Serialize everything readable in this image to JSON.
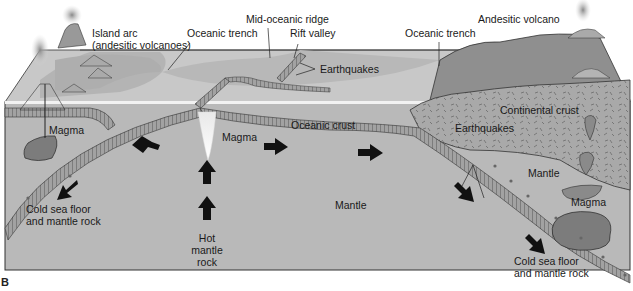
{
  "figure": {
    "panel_letter": "B",
    "type": "cross-section diagram"
  },
  "colors": {
    "mantle": "#b9b9b9",
    "ocean_surface": "#c9c9c9",
    "sea_floor": "#b0b0b0",
    "oceanic_crust": "#9a9a9a",
    "continental_crust": "#a8a8a8",
    "continent_land": "#8f8f8f",
    "magma": "#7c7c7c",
    "arrow": "#111111",
    "outline": "#333333"
  },
  "labels": {
    "island_arc_line1": "Island arc",
    "island_arc_line2": "(andesitic volcanoes)",
    "oceanic_trench_left": "Oceanic trench",
    "mid_oceanic_ridge": "Mid-oceanic ridge",
    "rift_valley": "Rift valley",
    "oceanic_trench_right": "Oceanic trench",
    "andesitic_volcano": "Andesitic volcano",
    "earthquakes_top": "Earthquakes",
    "continental_crust": "Continental crust",
    "earthquakes_mid": "Earthquakes",
    "magma_left": "Magma",
    "magma_center": "Magma",
    "oceanic_crust": "Oceanic crust",
    "mantle_right": "Mantle",
    "magma_right": "Magma",
    "mantle_center": "Mantle",
    "cold_left_line1": "Cold sea floor",
    "cold_left_line2": "and mantle rock",
    "hot_line1": "Hot",
    "hot_line2": "mantle",
    "hot_line3": "rock",
    "cold_right_line1": "Cold sea floor",
    "cold_right_line2": "and mantle rock"
  },
  "arrows": [
    {
      "id": "spread-left",
      "direction": "left"
    },
    {
      "id": "spread-right-1",
      "direction": "right"
    },
    {
      "id": "spread-right-2",
      "direction": "right"
    },
    {
      "id": "sink-left",
      "direction": "down-left"
    },
    {
      "id": "sink-right-1",
      "direction": "down-right"
    },
    {
      "id": "sink-right-2",
      "direction": "down-right"
    },
    {
      "id": "rise-1",
      "direction": "up"
    },
    {
      "id": "rise-2",
      "direction": "up"
    }
  ]
}
